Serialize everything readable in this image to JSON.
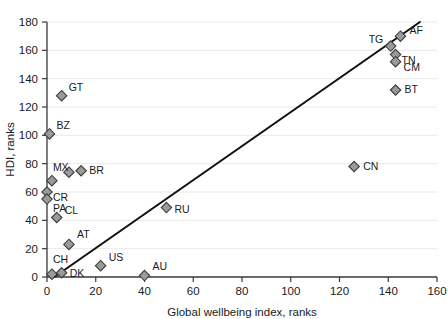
{
  "chart_data": {
    "type": "scatter",
    "title": "",
    "xlabel": "Global wellbeing index, ranks",
    "ylabel": "HDI, ranks",
    "xlim": [
      0,
      160
    ],
    "ylim": [
      0,
      180
    ],
    "xticks": [
      0,
      20,
      40,
      60,
      80,
      100,
      120,
      140,
      160
    ],
    "yticks": [
      0,
      20,
      40,
      60,
      80,
      100,
      120,
      140,
      160,
      180
    ],
    "grid": "horizontal",
    "legend": "none",
    "marker_style": "diamond",
    "marker_color": "#9a9a9a",
    "marker_edge_color": "#3d3d3d",
    "trend_line": {
      "visible": true,
      "color": "#111111",
      "x_start": 3,
      "y_start": 0,
      "x_end": 153,
      "y_end": 180
    },
    "points": [
      {
        "label": "GT",
        "x": 6,
        "y": 128,
        "label_dx": 7,
        "label_dy": -5
      },
      {
        "label": "BZ",
        "x": 1,
        "y": 101,
        "label_dx": 7,
        "label_dy": -5
      },
      {
        "label": "MX",
        "x": 2,
        "y": 68,
        "label_dx": 1,
        "label_dy": -10
      },
      {
        "label": "BR",
        "x": 14,
        "y": 75,
        "label_dx": 8,
        "label_dy": 3
      },
      {
        "label": "BR2",
        "x": 9,
        "y": 74,
        "label_dx": 0,
        "label_dy": 0
      },
      {
        "label": "CR",
        "x": 0,
        "y": 60,
        "label_dx": 6,
        "label_dy": 9
      },
      {
        "label": "PA",
        "x": 0,
        "y": 55,
        "label_dx": 6,
        "label_dy": 13
      },
      {
        "label": "CL",
        "x": 4,
        "y": 42,
        "label_dx": 8,
        "label_dy": -4
      },
      {
        "label": "AT",
        "x": 9,
        "y": 23,
        "label_dx": 8,
        "label_dy": -6
      },
      {
        "label": "CH",
        "x": 2,
        "y": 2,
        "label_dx": 1,
        "label_dy": -11
      },
      {
        "label": "DK",
        "x": 6,
        "y": 3,
        "label_dx": 8,
        "label_dy": 4
      },
      {
        "label": "US",
        "x": 22,
        "y": 8,
        "label_dx": 8,
        "label_dy": -5
      },
      {
        "label": "AU",
        "x": 40,
        "y": 1,
        "label_dx": 8,
        "label_dy": -6
      },
      {
        "label": "RU",
        "x": 49,
        "y": 49,
        "label_dx": 8,
        "label_dy": 5
      },
      {
        "label": "CN",
        "x": 126,
        "y": 78,
        "label_dx": 9,
        "label_dy": 3
      },
      {
        "label": "BT",
        "x": 143,
        "y": 132,
        "label_dx": 9,
        "label_dy": 3
      },
      {
        "label": "AF",
        "x": 145,
        "y": 170,
        "label_dx": 9,
        "label_dy": -2
      },
      {
        "label": "TG",
        "x": 141,
        "y": 163,
        "label_dx": -22,
        "label_dy": -3
      },
      {
        "label": "TN",
        "x": 143,
        "y": 157,
        "label_dx": 6,
        "label_dy": 9
      },
      {
        "label": "CM",
        "x": 143,
        "y": 152,
        "label_dx": 8,
        "label_dy": 9
      }
    ]
  }
}
